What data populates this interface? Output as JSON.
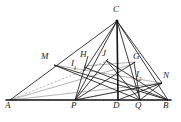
{
  "figure": {
    "width": 181,
    "height": 122,
    "background": "#ffffff",
    "stroke_color": "#1a1a1a",
    "thin_stroke_color": "#555555",
    "labels": {
      "A": "A",
      "B": "B",
      "C": "C",
      "D": "D",
      "G": "G",
      "H": "H",
      "J": "J",
      "M": "M",
      "N": "N",
      "P": "P",
      "Q": "Q",
      "I1_base": "I",
      "I1_sub": "1",
      "I2_base": "I",
      "I2_sub": "2"
    },
    "points": {
      "A": {
        "x": 10,
        "y": 100
      },
      "P": {
        "x": 75,
        "y": 100
      },
      "D": {
        "x": 118,
        "y": 100
      },
      "Q": {
        "x": 140,
        "y": 100
      },
      "B": {
        "x": 168,
        "y": 100
      },
      "C": {
        "x": 117,
        "y": 21
      },
      "M": {
        "x": 54,
        "y": 65
      },
      "N": {
        "x": 162,
        "y": 83
      },
      "H": {
        "x": 88,
        "y": 63
      },
      "J": {
        "x": 107,
        "y": 62
      },
      "G": {
        "x": 133,
        "y": 64
      },
      "I1": {
        "x": 84,
        "y": 71
      },
      "I2": {
        "x": 141,
        "y": 81
      }
    },
    "label_positions": {
      "A": {
        "x": 5,
        "y": 104
      },
      "P": {
        "x": 72,
        "y": 104
      },
      "D": {
        "x": 114,
        "y": 104
      },
      "Q": {
        "x": 136,
        "y": 104
      },
      "B": {
        "x": 164,
        "y": 104
      },
      "C": {
        "x": 113,
        "y": 5
      },
      "M": {
        "x": 42,
        "y": 53
      },
      "N": {
        "x": 163,
        "y": 72
      },
      "H": {
        "x": 81,
        "y": 51
      },
      "J": {
        "x": 102,
        "y": 50
      },
      "G": {
        "x": 134,
        "y": 53
      },
      "I1": {
        "x": 72,
        "y": 60
      },
      "I2": {
        "x": 137,
        "y": 71
      }
    }
  }
}
